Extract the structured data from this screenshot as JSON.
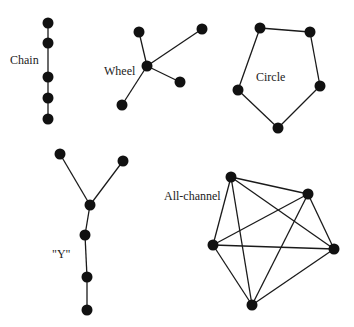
{
  "diagram": {
    "colors": {
      "node": "#111111",
      "edge": "#1a1a1a",
      "text": "#222222",
      "background": "#ffffff"
    },
    "networks": [
      {
        "id": "chain",
        "label": "Chain",
        "label_pos": [
          10,
          64
        ],
        "nodes": [
          [
            48,
            23
          ],
          [
            48,
            43
          ],
          [
            48,
            77
          ],
          [
            48,
            98
          ],
          [
            48,
            119
          ]
        ],
        "edges": [
          [
            0,
            1
          ],
          [
            1,
            2
          ],
          [
            2,
            3
          ],
          [
            3,
            4
          ]
        ]
      },
      {
        "id": "wheel",
        "label": "Wheel",
        "label_pos": [
          104,
          75
        ],
        "nodes": [
          [
            147,
            66
          ],
          [
            139,
            32
          ],
          [
            202,
            29
          ],
          [
            180,
            82
          ],
          [
            122,
            105
          ]
        ],
        "edges": [
          [
            0,
            1
          ],
          [
            0,
            2
          ],
          [
            0,
            3
          ],
          [
            0,
            4
          ]
        ]
      },
      {
        "id": "circle",
        "label": "Circle",
        "label_pos": [
          256,
          81
        ],
        "nodes": [
          [
            260,
            28
          ],
          [
            310,
            32
          ],
          [
            320,
            86
          ],
          [
            278,
            128
          ],
          [
            238,
            90
          ]
        ],
        "edges": [
          [
            0,
            1
          ],
          [
            1,
            2
          ],
          [
            2,
            3
          ],
          [
            3,
            4
          ],
          [
            4,
            0
          ]
        ]
      },
      {
        "id": "y",
        "label": "\"Y\"",
        "label_pos": [
          52,
          258
        ],
        "nodes": [
          [
            60,
            154
          ],
          [
            123,
            161
          ],
          [
            90,
            205
          ],
          [
            85,
            235
          ],
          [
            87,
            277
          ],
          [
            87,
            310
          ]
        ],
        "edges": [
          [
            0,
            2
          ],
          [
            1,
            2
          ],
          [
            2,
            3
          ],
          [
            3,
            4
          ],
          [
            4,
            5
          ]
        ]
      },
      {
        "id": "all-channel",
        "label": "All-channel",
        "label_pos": [
          164,
          200
        ],
        "nodes": [
          [
            231,
            177
          ],
          [
            308,
            194
          ],
          [
            334,
            249
          ],
          [
            252,
            305
          ],
          [
            213,
            245
          ]
        ],
        "edges": [
          [
            0,
            1
          ],
          [
            0,
            2
          ],
          [
            0,
            3
          ],
          [
            0,
            4
          ],
          [
            1,
            2
          ],
          [
            1,
            3
          ],
          [
            1,
            4
          ],
          [
            2,
            3
          ],
          [
            2,
            4
          ],
          [
            3,
            4
          ]
        ]
      }
    ]
  }
}
